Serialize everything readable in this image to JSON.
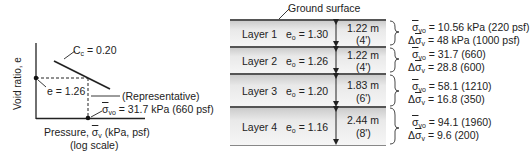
{
  "graph": {
    "y_axis_label": "Void ratio, e",
    "x_axis_label_prefix": "Pressure, ",
    "x_axis_symbol": "σ",
    "x_axis_sub": "v",
    "x_axis_label_suffix": " (kPa, psf)",
    "x_axis_note": "(log scale)",
    "cc_label_prefix": "C",
    "cc_label_sub": "c",
    "cc_label_value": " = 0.20",
    "e_label": "e = 1.26",
    "representative_label": "(Representative)",
    "sigma_symbol": "σ",
    "sigma_sub": "vo",
    "sigma_value": " = 31.7 kPa (660 psf)"
  },
  "profile": {
    "ground_surface_label": "Ground surface",
    "layers": [
      {
        "name": "Layer 1",
        "eo_prefix": "e",
        "eo_sub": "o",
        "eo_value": " = 1.30",
        "thickness_m": "1.22 m",
        "thickness_ft": "(4')",
        "sigma_vo": " = 10.56 kPa (220 psf)",
        "delta_sigma_v": " = 48 kPa (1000 psf)"
      },
      {
        "name": "Layer 2",
        "eo_prefix": "e",
        "eo_sub": "o",
        "eo_value": " = 1.26",
        "thickness_m": "1.22 m",
        "thickness_ft": "(4')",
        "sigma_vo": " = 31.7 (660)",
        "delta_sigma_v": " = 28.8 (600)"
      },
      {
        "name": "Layer 3",
        "eo_prefix": "e",
        "eo_sub": "o",
        "eo_value": " = 1.20",
        "thickness_m": "1.83 m",
        "thickness_ft": "(6')",
        "sigma_vo": " = 58.1 (1210)",
        "delta_sigma_v": " = 16.8 (350)"
      },
      {
        "name": "Layer 4",
        "eo_prefix": "e",
        "eo_sub": "o",
        "eo_value": " = 1.16",
        "thickness_m": "2.44 m",
        "thickness_ft": "(8')",
        "sigma_vo": " = 94.1 (1960)",
        "delta_sigma_v": " = 9.6 (200)"
      }
    ],
    "sigma_symbol": "σ",
    "sigma_vo_sub": "vo",
    "delta_prefix": "Δ",
    "sigma_v_sub": "v"
  }
}
